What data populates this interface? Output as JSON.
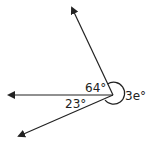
{
  "diagram": {
    "type": "angles-at-a-point",
    "labels": {
      "angle_top": "64°",
      "angle_bottom": "23°",
      "angle_reflex": "3e°"
    },
    "rays": [
      "top",
      "left",
      "bottom-left"
    ],
    "colors": {
      "stroke": "#222222",
      "background": "#ffffff"
    }
  }
}
